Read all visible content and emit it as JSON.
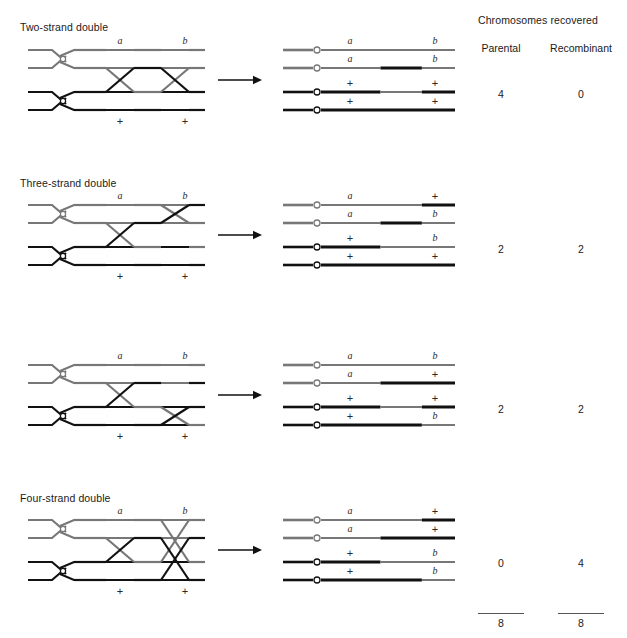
{
  "header": {
    "title": "Chromosomes recovered",
    "col_parental": "Parental",
    "col_recombinant": "Recombinant"
  },
  "colors": {
    "gray_chromatid": "#777777",
    "black_chromatid": "#111111",
    "text": "#1a1a1a",
    "background": "#ffffff"
  },
  "labels": {
    "a": "a",
    "b": "b",
    "plus": "+"
  },
  "totals": {
    "parental": "8",
    "recombinant": "8"
  },
  "rows": [
    {
      "title": "Two-strand double",
      "top_left_label": "a",
      "top_right_label": "b",
      "bottom_left_label": "+",
      "bottom_right_label": "+",
      "parental": "4",
      "recombinant": "0",
      "crossovers": [
        {
          "between": [
            2,
            3
          ]
        },
        {
          "between": [
            2,
            3
          ]
        }
      ],
      "products": [
        {
          "left": "a",
          "right": "b",
          "segments": [
            {
              "color": "gray",
              "from": 0,
              "to": 1
            }
          ]
        },
        {
          "left": "a",
          "right": "b",
          "segments": [
            {
              "color": "gray",
              "from": 0,
              "to": 0.46
            },
            {
              "color": "black",
              "from": 0.46,
              "to": 0.76
            },
            {
              "color": "gray",
              "from": 0.76,
              "to": 1
            }
          ]
        },
        {
          "left": "+",
          "right": "+",
          "segments": [
            {
              "color": "black",
              "from": 0,
              "to": 0.46
            },
            {
              "color": "gray",
              "from": 0.46,
              "to": 0.76
            },
            {
              "color": "black",
              "from": 0.76,
              "to": 1
            }
          ]
        },
        {
          "left": "+",
          "right": "+",
          "segments": [
            {
              "color": "black",
              "from": 0,
              "to": 1
            }
          ]
        }
      ]
    },
    {
      "title": "Three-strand double",
      "top_left_label": "a",
      "top_right_label": "b",
      "bottom_left_label": "+",
      "bottom_right_label": "+",
      "parental": "2",
      "recombinant": "2",
      "crossovers": [
        {
          "between": [
            2,
            3
          ]
        },
        {
          "between": [
            1,
            3
          ]
        }
      ],
      "products": [
        {
          "left": "a",
          "right": "+",
          "segments": [
            {
              "color": "gray",
              "from": 0,
              "to": 0.76
            },
            {
              "color": "black",
              "from": 0.76,
              "to": 1
            }
          ]
        },
        {
          "left": "a",
          "right": "b",
          "segments": [
            {
              "color": "gray",
              "from": 0,
              "to": 0.46
            },
            {
              "color": "black",
              "from": 0.46,
              "to": 0.76
            },
            {
              "color": "gray",
              "from": 0.76,
              "to": 1
            }
          ]
        },
        {
          "left": "+",
          "right": "b",
          "segments": [
            {
              "color": "black",
              "from": 0,
              "to": 0.46
            },
            {
              "color": "gray",
              "from": 0.46,
              "to": 1
            }
          ]
        },
        {
          "left": "+",
          "right": "+",
          "segments": [
            {
              "color": "black",
              "from": 0,
              "to": 1
            }
          ]
        }
      ]
    },
    {
      "title": "",
      "top_left_label": "a",
      "top_right_label": "b",
      "bottom_left_label": "+",
      "bottom_right_label": "+",
      "parental": "2",
      "recombinant": "2",
      "crossovers": [
        {
          "between": [
            2,
            3
          ]
        },
        {
          "between": [
            2,
            4
          ]
        }
      ],
      "products": [
        {
          "left": "a",
          "right": "b",
          "segments": [
            {
              "color": "gray",
              "from": 0,
              "to": 1
            }
          ]
        },
        {
          "left": "a",
          "right": "+",
          "segments": [
            {
              "color": "gray",
              "from": 0,
              "to": 0.46
            },
            {
              "color": "black",
              "from": 0.46,
              "to": 1
            }
          ]
        },
        {
          "left": "+",
          "right": "+",
          "segments": [
            {
              "color": "black",
              "from": 0,
              "to": 0.46
            },
            {
              "color": "gray",
              "from": 0.46,
              "to": 0.76
            },
            {
              "color": "black",
              "from": 0.76,
              "to": 1
            }
          ]
        },
        {
          "left": "+",
          "right": "b",
          "segments": [
            {
              "color": "black",
              "from": 0,
              "to": 0.76
            },
            {
              "color": "gray",
              "from": 0.76,
              "to": 1
            }
          ]
        }
      ]
    },
    {
      "title": "Four-strand double",
      "top_left_label": "a",
      "top_right_label": "b",
      "bottom_left_label": "+",
      "bottom_right_label": "+",
      "parental": "0",
      "recombinant": "4",
      "crossovers": [
        {
          "between": [
            2,
            3
          ]
        },
        {
          "between": [
            1,
            2
          ]
        },
        {
          "between": [
            3,
            4
          ]
        }
      ],
      "products": [
        {
          "left": "a",
          "right": "+",
          "segments": [
            {
              "color": "gray",
              "from": 0,
              "to": 0.76
            },
            {
              "color": "black",
              "from": 0.76,
              "to": 1
            }
          ]
        },
        {
          "left": "a",
          "right": "+",
          "segments": [
            {
              "color": "gray",
              "from": 0,
              "to": 0.46
            },
            {
              "color": "black",
              "from": 0.46,
              "to": 1
            }
          ]
        },
        {
          "left": "+",
          "right": "b",
          "segments": [
            {
              "color": "black",
              "from": 0,
              "to": 0.46
            },
            {
              "color": "gray",
              "from": 0.46,
              "to": 1
            }
          ]
        },
        {
          "left": "+",
          "right": "b",
          "segments": [
            {
              "color": "black",
              "from": 0,
              "to": 0.76
            },
            {
              "color": "gray",
              "from": 0.76,
              "to": 1
            }
          ]
        }
      ]
    }
  ]
}
